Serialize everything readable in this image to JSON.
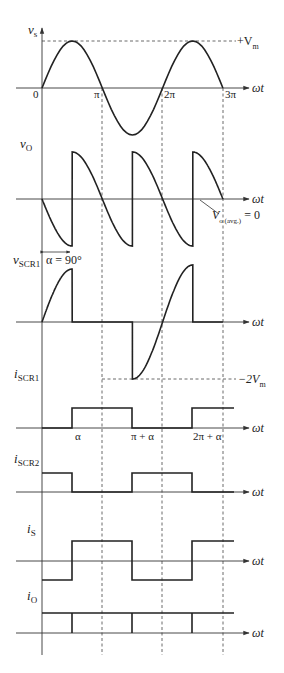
{
  "diagram": {
    "x_axis_label": "ωt",
    "colors": {
      "trace": "#222222",
      "axis": "#333333",
      "background": "#ffffff"
    },
    "x_ticks": [
      "0",
      "π",
      "2π",
      "3π"
    ],
    "angle_ticks": [
      "α",
      "π + α",
      "2π + α"
    ],
    "panels": [
      {
        "id": "vs",
        "label": "v",
        "sub": "s",
        "annotation_sup": "+V",
        "annotation_sub": "m"
      },
      {
        "id": "vo",
        "label": "v",
        "sub": "O",
        "annotation": "V",
        "annotation_sub": "o (avg.)",
        "annotation_tail": " = 0"
      },
      {
        "id": "vscr1",
        "label": "v",
        "sub": "SCR1",
        "alpha_label": "α = 90°",
        "annotation": "−2V",
        "annotation_sub": "m"
      },
      {
        "id": "iscr1",
        "label": "i",
        "sub": "SCR1"
      },
      {
        "id": "iscr2",
        "label": "i",
        "sub": "SCR2"
      },
      {
        "id": "is",
        "label": "i",
        "sub": "S"
      },
      {
        "id": "io",
        "label": "i",
        "sub": "O"
      }
    ]
  },
  "chart_data": {
    "type": "line",
    "title": "",
    "xlabel": "ωt",
    "alpha_deg": 90,
    "x": [
      "0",
      "π/2",
      "π",
      "3π/2",
      "2π",
      "5π/2",
      "3π"
    ],
    "series": [
      {
        "name": "v_s",
        "values": [
          0,
          1,
          0,
          -1,
          0,
          1,
          0
        ]
      },
      {
        "name": "v_O",
        "values": [
          0,
          "-1→+1",
          0,
          "-1→+1",
          0,
          "+1",
          0
        ]
      },
      {
        "name": "v_SCR1",
        "values": [
          0,
          "1→0",
          0,
          "0→-2",
          0,
          "2→0",
          0
        ]
      },
      {
        "name": "i_SCR1",
        "values": [
          0,
          "0→1",
          1,
          "1→0",
          0,
          "0→1",
          1
        ]
      },
      {
        "name": "i_SCR2",
        "values": [
          1,
          "1→0",
          0,
          "0→1",
          1,
          "1→0",
          0
        ]
      },
      {
        "name": "i_S",
        "values": [
          -1,
          "-1→1",
          1,
          "1→-1",
          -1,
          "-1→1",
          1
        ]
      },
      {
        "name": "i_O",
        "values": [
          1,
          1,
          1,
          1,
          1,
          1,
          1
        ]
      }
    ],
    "annotations": [
      "+V_m",
      "V_o(avg.) = 0",
      "α = 90°",
      "−2V_m",
      "α",
      "π + α",
      "2π + α"
    ]
  }
}
